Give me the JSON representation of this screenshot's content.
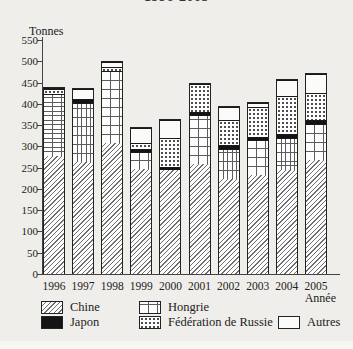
{
  "title": "1996-2005",
  "chart_data": {
    "type": "bar",
    "stacked": true,
    "title": "1996-2005",
    "unit_label": "Tonnes",
    "xlabel": "Année",
    "ylim": [
      0,
      550
    ],
    "ytick_step": 50,
    "grid": false,
    "legend_position": "bottom",
    "categories": [
      "1996",
      "1997",
      "1998",
      "1999",
      "2000",
      "2001",
      "2002",
      "2003",
      "2004",
      "2005"
    ],
    "series": [
      {
        "name": "Chine",
        "pattern": "diagonal-hatch",
        "values": [
          280,
          265,
          310,
          248,
          245,
          260,
          225,
          234,
          245,
          270
        ]
      },
      {
        "name": "Hongrie",
        "pattern": "grid",
        "values": [
          145,
          140,
          170,
          40,
          0,
          115,
          70,
          82,
          77,
          84
        ]
      },
      {
        "name": "Japon",
        "pattern": "solid-black",
        "values": [
          0,
          9,
          0,
          8,
          8,
          8,
          9,
          8,
          8,
          9
        ]
      },
      {
        "name": "Fédération de Russie",
        "pattern": "dots",
        "values": [
          12,
          0,
          10,
          14,
          68,
          67,
          59,
          70,
          90,
          65
        ]
      },
      {
        "name": "Autres",
        "pattern": "white",
        "values": [
          3,
          24,
          10,
          35,
          44,
          0,
          31,
          11,
          38,
          45
        ]
      }
    ],
    "totals": [
      440,
      438,
      500,
      345,
      365,
      450,
      394,
      405,
      458,
      473
    ],
    "legend_order": [
      "Chine",
      "Hongrie",
      "Japon",
      "Fédération de Russie",
      "Autres"
    ]
  },
  "colors": {
    "background": "#efeeea",
    "axis": "#444444",
    "bar_fill": "#fdfdfd",
    "bar_outline": "#222222",
    "japon_fill": "#141414",
    "text": "#222222"
  }
}
